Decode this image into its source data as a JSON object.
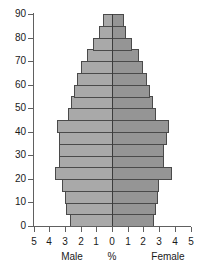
{
  "chart_data": {
    "type": "bar",
    "title": "",
    "subtitle": "",
    "xlabel": "%",
    "ylabel": "",
    "orientation": "horizontal-diverging",
    "chart_kind": "population-pyramid",
    "grid": false,
    "legend_position": "below-axis",
    "xlim": [
      -5,
      5
    ],
    "ylim": [
      0,
      90
    ],
    "x_tick_labels": [
      "5",
      "4",
      "3",
      "2",
      "1",
      "0",
      "1",
      "2",
      "3",
      "4",
      "5"
    ],
    "x_tick_values": [
      -5,
      -4,
      -3,
      -2,
      -1,
      0,
      1,
      2,
      3,
      4,
      5
    ],
    "y_tick_labels": [
      "0",
      "10",
      "20",
      "30",
      "40",
      "50",
      "60",
      "70",
      "80",
      "90"
    ],
    "y_tick_values": [
      0,
      10,
      20,
      30,
      40,
      50,
      60,
      70,
      80,
      90
    ],
    "categories": [
      "0-5",
      "5-10",
      "10-15",
      "15-20",
      "20-25",
      "25-30",
      "30-35",
      "35-40",
      "40-45",
      "45-50",
      "50-55",
      "55-60",
      "60-65",
      "65-70",
      "70-75",
      "75-80",
      "80-85",
      "85-90"
    ],
    "age_band_lower": [
      0,
      5,
      10,
      15,
      20,
      25,
      30,
      35,
      40,
      45,
      50,
      55,
      60,
      65,
      70,
      75,
      80,
      85
    ],
    "age_band_upper": [
      5,
      10,
      15,
      20,
      25,
      30,
      35,
      40,
      45,
      50,
      55,
      60,
      65,
      70,
      75,
      80,
      85,
      90
    ],
    "series": [
      {
        "name": "Male",
        "side": "left",
        "color": "#a9a9a9",
        "values": [
          2.7,
          2.9,
          3.0,
          3.2,
          3.6,
          3.4,
          3.4,
          3.4,
          3.5,
          2.8,
          2.6,
          2.4,
          2.2,
          2.0,
          1.6,
          1.2,
          0.8,
          0.55
        ]
      },
      {
        "name": "Female",
        "side": "right",
        "color": "#959595",
        "values": [
          2.7,
          2.8,
          2.9,
          3.0,
          3.8,
          3.3,
          3.3,
          3.5,
          3.6,
          2.8,
          2.6,
          2.4,
          2.2,
          2.0,
          1.7,
          1.3,
          0.9,
          0.75
        ]
      }
    ],
    "annotations": []
  },
  "axis": {
    "male_label": "Male",
    "percent_label": "%",
    "female_label": "Female"
  },
  "colors": {
    "male_bar": "#a9a9a9",
    "female_bar": "#959595",
    "bar_outline": "#4a4a4a",
    "axis": "#606060",
    "center_line": "#3c3c3c",
    "text": "#1a1a1a",
    "background": "#ffffff"
  }
}
